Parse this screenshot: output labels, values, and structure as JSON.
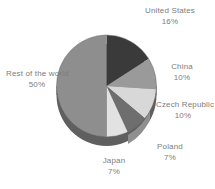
{
  "chart_data": {
    "type": "pie",
    "title": "",
    "subtitle": "",
    "xlabel": "",
    "ylabel": "",
    "legend_position": "none",
    "grid": false,
    "labels_position": "outside",
    "start_angle_deg": 0,
    "direction": "clockwise",
    "three_d": true,
    "categories": [
      "United States",
      "China",
      "Czech Republic",
      "Poland",
      "Japan",
      "Rest of the world"
    ],
    "values": [
      16,
      10,
      10,
      7,
      7,
      50
    ],
    "value_suffix": "%",
    "slices": [
      {
        "label": "United States",
        "value": 16,
        "value_text": "16%",
        "color": "#3a3a3a"
      },
      {
        "label": "China",
        "value": 10,
        "value_text": "10%",
        "color": "#9a9a9a"
      },
      {
        "label": "Czech Republic",
        "value": 10,
        "value_text": "10%",
        "color": "#d8d8d8"
      },
      {
        "label": "Poland",
        "value": 7,
        "value_text": "7%",
        "color": "#6e6e6e"
      },
      {
        "label": "Japan",
        "value": 7,
        "value_text": "7%",
        "color": "#e2e2e2"
      },
      {
        "label": "Rest of the world",
        "value": 50,
        "value_text": "50%",
        "color": "#8e8e8e"
      }
    ]
  },
  "labels": {
    "united_states": {
      "name": "United States",
      "pct": "16%"
    },
    "china": {
      "name": "China",
      "pct": "10%"
    },
    "czech": {
      "name": "Czech Republic",
      "pct": "10%"
    },
    "poland": {
      "name": "Poland",
      "pct": "7%"
    },
    "japan": {
      "name": "Japan",
      "pct": "7%"
    },
    "rest": {
      "name": "Rest of the world",
      "pct": "50%"
    }
  },
  "colors": {
    "background": "#ffffff",
    "label_text": "#7d7d7d",
    "pie_side_dark": "#5f5f5f",
    "slice_united_states": "#3a3a3a",
    "slice_china": "#9a9a9a",
    "slice_czech": "#d8d8d8",
    "slice_poland": "#6e6e6e",
    "slice_japan": "#e2e2e2",
    "slice_rest": "#8e8e8e"
  }
}
